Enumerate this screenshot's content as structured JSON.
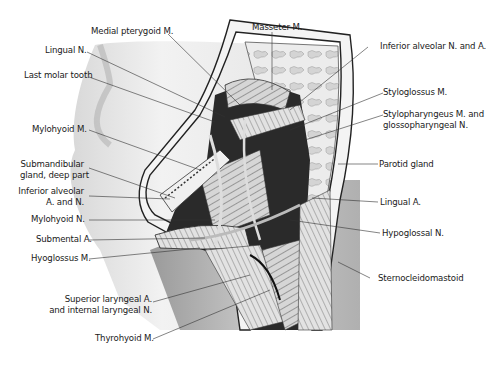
{
  "figure": {
    "type": "anatomical-illustration",
    "labels_left": [
      {
        "id": "medial-pterygoid",
        "text": "Medial pterygoid M."
      },
      {
        "id": "lingual-n",
        "text": "Lingual N."
      },
      {
        "id": "last-molar",
        "text": "Last molar tooth"
      },
      {
        "id": "mylohyoid-m",
        "text": "Mylohyoid M."
      },
      {
        "id": "submandibular",
        "line1": "Submandibular",
        "line2": "gland, deep part"
      },
      {
        "id": "inf-alveolar-an",
        "line1": "Inferior alveolar",
        "line2": "A. and N."
      },
      {
        "id": "mylohyoid-n",
        "text": "Mylohyoid N."
      },
      {
        "id": "submental-a",
        "text": "Submental A."
      },
      {
        "id": "hyoglossus",
        "text": "Hyoglossus M."
      },
      {
        "id": "sup-laryngeal",
        "line1": "Superior laryngeal  A.",
        "line2": "and internal laryngeal N."
      },
      {
        "id": "thyrohyoid",
        "text": "Thyrohyoid M."
      }
    ],
    "labels_right": [
      {
        "id": "masseter",
        "text": "Masseter M."
      },
      {
        "id": "inf-alveolar-na",
        "text": "Inferior alveolar N. and A."
      },
      {
        "id": "styloglossus",
        "text": "Styloglossus M."
      },
      {
        "id": "stylopharyngeus",
        "line1": "Stylopharyngeus M. and",
        "line2": "glossopharyngeal N."
      },
      {
        "id": "parotid",
        "text": "Parotid gland"
      },
      {
        "id": "lingual-a",
        "text": "Lingual A."
      },
      {
        "id": "hypoglossal",
        "text": "Hypoglossal N."
      },
      {
        "id": "sternocleidomastoid",
        "text": "Sternocleidomastoid"
      }
    ]
  }
}
